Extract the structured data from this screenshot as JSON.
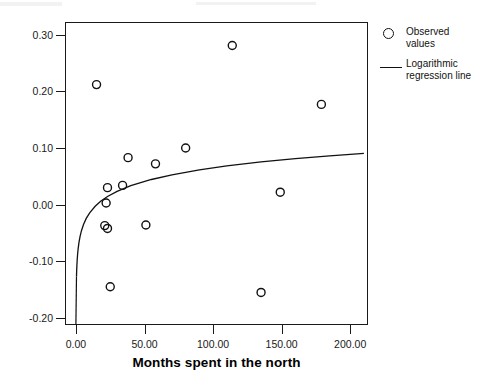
{
  "chart_data": {
    "type": "scatter",
    "title": "",
    "subtitle": "",
    "xlabel": "Months spent in the north",
    "ylabel": "",
    "xlim": [
      -8,
      213
    ],
    "ylim": [
      -0.2125,
      0.3225
    ],
    "xticks": [
      0,
      50,
      100,
      150,
      200
    ],
    "xticklabels": [
      "0.00",
      "50.00",
      "100.00",
      "150.00",
      "200.00"
    ],
    "yticks": [
      -0.2,
      -0.1,
      0.0,
      0.1,
      0.2,
      0.3
    ],
    "yticklabels": [
      "-0.20",
      "-0.10",
      "0.00",
      "0.10",
      "0.20",
      "0.30"
    ],
    "grid": false,
    "legend_position": "right-outside",
    "series": [
      {
        "name": "Observed values",
        "type": "scatter",
        "marker": "open-circle",
        "color": "#111111",
        "points": [
          {
            "x": 15,
            "y": 0.212
          },
          {
            "x": 114,
            "y": 0.281
          },
          {
            "x": 179,
            "y": 0.177
          },
          {
            "x": 38,
            "y": 0.083
          },
          {
            "x": 80,
            "y": 0.1
          },
          {
            "x": 58,
            "y": 0.072
          },
          {
            "x": 149,
            "y": 0.022
          },
          {
            "x": 23,
            "y": 0.03
          },
          {
            "x": 34,
            "y": 0.034
          },
          {
            "x": 22,
            "y": 0.003
          },
          {
            "x": 21,
            "y": -0.037
          },
          {
            "x": 23,
            "y": -0.042
          },
          {
            "x": 51,
            "y": -0.036
          },
          {
            "x": 25,
            "y": -0.145
          },
          {
            "x": 135,
            "y": -0.155
          }
        ]
      },
      {
        "name": "Logarithmic regression line",
        "type": "line",
        "color": "#111111",
        "equation_form": "y = a + b*ln(x)",
        "a": -0.0938,
        "b": 0.0345,
        "points": [
          {
            "x": 0.38,
            "y": -0.1271
          },
          {
            "x": 0.45,
            "y": -0.1213
          },
          {
            "x": 0.55,
            "y": -0.1143
          },
          {
            "x": 0.7,
            "y": -0.106
          },
          {
            "x": 0.9,
            "y": -0.0974
          },
          {
            "x": 1.2,
            "y": -0.0875
          },
          {
            "x": 1.6,
            "y": -0.0776
          },
          {
            "x": 2.2,
            "y": -0.0666
          },
          {
            "x": 3.0,
            "y": -0.0559
          },
          {
            "x": 4.0,
            "y": -0.046
          },
          {
            "x": 5.5,
            "y": -0.035
          },
          {
            "x": 7.5,
            "y": -0.0243
          },
          {
            "x": 10,
            "y": -0.0144
          },
          {
            "x": 14,
            "y": -0.0028
          },
          {
            "x": 18,
            "y": 0.0059
          },
          {
            "x": 23,
            "y": 0.0144
          },
          {
            "x": 30,
            "y": 0.0235
          },
          {
            "x": 40,
            "y": 0.0334
          },
          {
            "x": 55,
            "y": 0.0444
          },
          {
            "x": 70,
            "y": 0.0527
          },
          {
            "x": 90,
            "y": 0.0614
          },
          {
            "x": 110,
            "y": 0.0683
          },
          {
            "x": 135,
            "y": 0.0754
          },
          {
            "x": 160,
            "y": 0.0812
          },
          {
            "x": 185,
            "y": 0.0862
          },
          {
            "x": 210,
            "y": 0.0906
          }
        ]
      }
    ]
  },
  "legend": {
    "entries": [
      {
        "key": "open-circle",
        "label_line1": "Observed",
        "label_line2": "values"
      },
      {
        "key": "line",
        "label_line1": "Logarithmic",
        "label_line2": "regression line"
      }
    ]
  },
  "axes": {
    "xlabel": "Months spent in the north"
  },
  "colors": {
    "axis": "#1a1a1a",
    "marker": "#111111",
    "line": "#111111",
    "background": "#ffffff"
  }
}
